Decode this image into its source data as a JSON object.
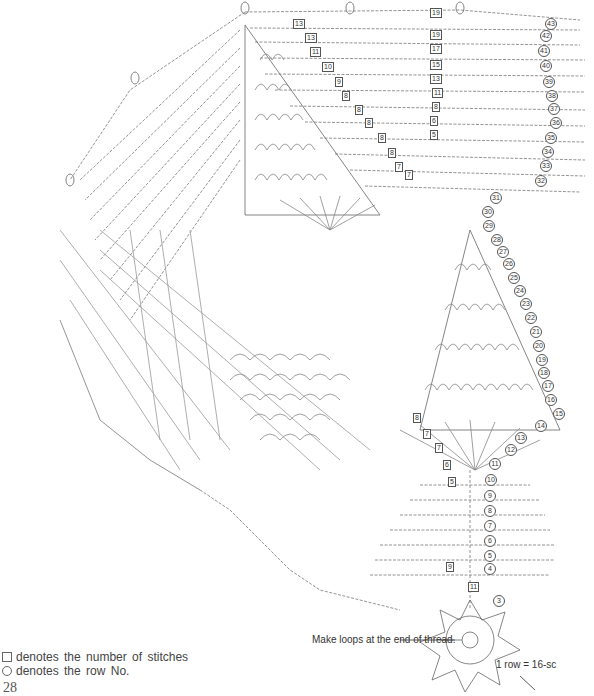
{
  "figure": {
    "type": "crochet-chart",
    "legend": {
      "square": "denotes the number of stitches",
      "circle": "denotes the row No."
    },
    "notes": {
      "loops": "Make loops at the end of thread.",
      "center": "1 row = 16-sc"
    },
    "page_number": "28",
    "row_numbers_right": [
      "43",
      "42",
      "41",
      "40",
      "39",
      "38",
      "37",
      "36",
      "35",
      "34",
      "33",
      "32",
      "31",
      "30",
      "29",
      "28",
      "27",
      "26",
      "25",
      "24",
      "23",
      "22",
      "21",
      "20",
      "19",
      "18",
      "17",
      "16",
      "15",
      "14",
      "13",
      "12",
      "11",
      "10",
      "9",
      "8",
      "7",
      "6",
      "5",
      "4",
      "3"
    ],
    "stitch_counts_top": [
      "19",
      "19",
      "17",
      "15",
      "13",
      "11",
      "8",
      "6",
      "5"
    ],
    "stitch_counts_center": [
      "13",
      "13",
      "11",
      "10",
      "9",
      "8",
      "8",
      "8",
      "8",
      "8",
      "7",
      "7"
    ],
    "stitch_counts_lower": [
      "8",
      "7",
      "7",
      "6",
      "5",
      "9",
      "11"
    ]
  }
}
